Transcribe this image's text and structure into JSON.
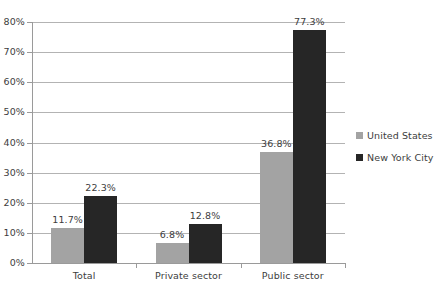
{
  "chart_data": {
    "type": "bar",
    "title": "",
    "subtitle": "",
    "xlabel": "",
    "ylabel": "",
    "ylim": [
      0,
      80
    ],
    "ytick_labels": [
      "0%",
      "10%",
      "20%",
      "30%",
      "40%",
      "50%",
      "60%",
      "70%",
      "80%"
    ],
    "ytick_values": [
      0,
      10,
      20,
      30,
      40,
      50,
      60,
      70,
      80
    ],
    "grid": "horizontal",
    "legend_position": "right",
    "categories": [
      "Total",
      "Private sector",
      "Public sector"
    ],
    "series": [
      {
        "name": "United States",
        "color": "#a3a3a3",
        "values": [
          11.7,
          6.8,
          36.8
        ],
        "labels": [
          "11.7%",
          "6.8%",
          "36.8%"
        ]
      },
      {
        "name": "New York City",
        "color": "#262626",
        "values": [
          22.3,
          12.8,
          77.3
        ],
        "labels": [
          "22.3%",
          "12.8%",
          "77.3%"
        ]
      }
    ]
  },
  "legend": {
    "items": [
      {
        "label": "United States",
        "color": "#a3a3a3",
        "swatch_name": "legend-swatch-united-states"
      },
      {
        "label": "New York City",
        "color": "#262626",
        "swatch_name": "legend-swatch-new-york-city"
      }
    ]
  },
  "axis": {
    "y_labels": [
      "80%",
      "70%",
      "60%",
      "50%",
      "40%",
      "30%",
      "20%",
      "10%",
      "0%"
    ],
    "x_labels": [
      "Total",
      "Private sector",
      "Public sector"
    ]
  }
}
